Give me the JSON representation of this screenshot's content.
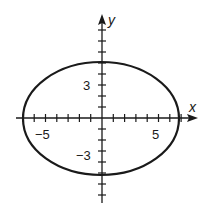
{
  "figure": {
    "type": "ellipse-graph",
    "equation_implied": "x^2/49 + y^2/25 = 1",
    "x_axis_label": "x",
    "y_axis_label": "y",
    "x_tick_labels": [
      {
        "value": -5,
        "text": "−5"
      },
      {
        "value": 5,
        "text": "5"
      }
    ],
    "y_tick_labels": [
      {
        "value": 3,
        "text": "3"
      },
      {
        "value": -3,
        "text": "−3"
      }
    ],
    "ellipse": {
      "center": [
        0,
        0
      ],
      "semi_axis_x": 7,
      "semi_axis_y": 5
    },
    "x_range": [
      -7.5,
      8.3
    ],
    "y_range": [
      -7.6,
      9.4
    ],
    "tick_step": 1,
    "colors": {
      "stroke": "#1a1a1a",
      "background": "#ffffff"
    }
  }
}
